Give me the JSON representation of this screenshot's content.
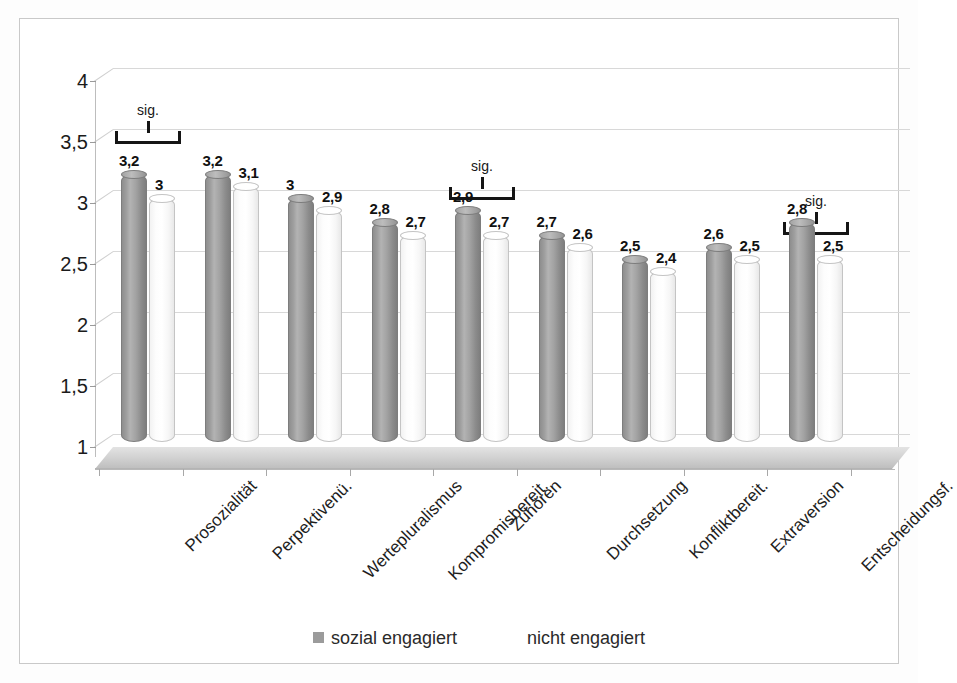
{
  "chart_data": {
    "type": "bar",
    "title": "",
    "subtitle": "",
    "xlabel": "",
    "ylabel": "",
    "ylim": [
      1,
      4
    ],
    "ytick_labels": [
      "4",
      "3,5",
      "3",
      "2,5",
      "2",
      "1,5",
      "1"
    ],
    "ytick_values": [
      4,
      3.5,
      3,
      2.5,
      2,
      1.5,
      1
    ],
    "grid": true,
    "legend_position": "bottom",
    "decimal_separator": ",",
    "categories": [
      "Prosozialität",
      "Perpektivenü.",
      "Wertepluralismus",
      "Kompromisbereit.",
      "Zuhören",
      "Durchsetzung",
      "Konfliktbereit.",
      "Extraversion",
      "Entscheidungsf."
    ],
    "series": [
      {
        "name": "sozial engagiert",
        "color": "#9b9b9b",
        "values": [
          3.2,
          3.2,
          3.0,
          2.8,
          2.9,
          2.7,
          2.5,
          2.6,
          2.8
        ],
        "value_labels": [
          "3,2",
          "3,2",
          "3",
          "2,8",
          "2,9",
          "2,7",
          "2,5",
          "2,6",
          "2,8"
        ]
      },
      {
        "name": "nicht engagiert",
        "color": "#ffffff",
        "values": [
          3.0,
          3.1,
          2.9,
          2.7,
          2.7,
          2.6,
          2.4,
          2.5,
          2.5
        ],
        "value_labels": [
          "3",
          "3,1",
          "2,9",
          "2,7",
          "2,7",
          "2,6",
          "2,4",
          "2,5",
          "2,5"
        ]
      }
    ],
    "annotations": [
      {
        "label": "sig.",
        "category": "Prosozialität",
        "category_index": 0
      },
      {
        "label": "sig.",
        "category": "Zuhören",
        "category_index": 4
      },
      {
        "label": "sig.",
        "category": "Entscheidungsf.",
        "category_index": 8
      }
    ]
  },
  "legend": {
    "entries": [
      {
        "label": "sozial engagiert",
        "swatch": "engaged"
      },
      {
        "label": "nicht engagiert",
        "swatch": "notengaged"
      }
    ]
  }
}
